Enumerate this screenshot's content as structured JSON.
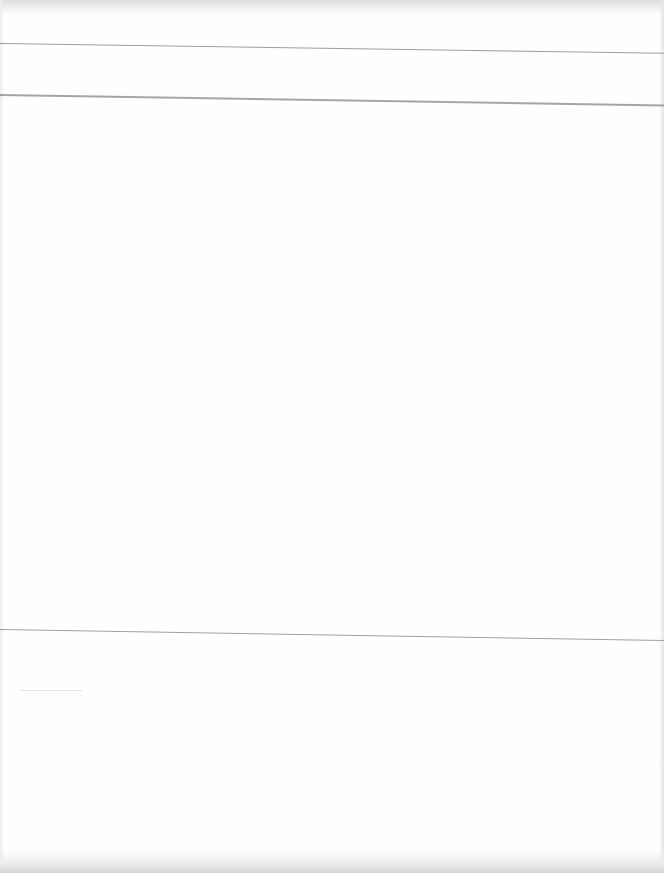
{
  "document": {
    "type": "blank scanned page",
    "text_content": "",
    "ruled_lines": [
      {
        "position": "top",
        "y": 43
      },
      {
        "position": "upper",
        "y": 94
      },
      {
        "position": "lower",
        "y": 629
      }
    ],
    "colors": {
      "paper": "#fefefe",
      "rule": "#9c9c9c",
      "scan_edge": "#d6d6d6"
    }
  }
}
